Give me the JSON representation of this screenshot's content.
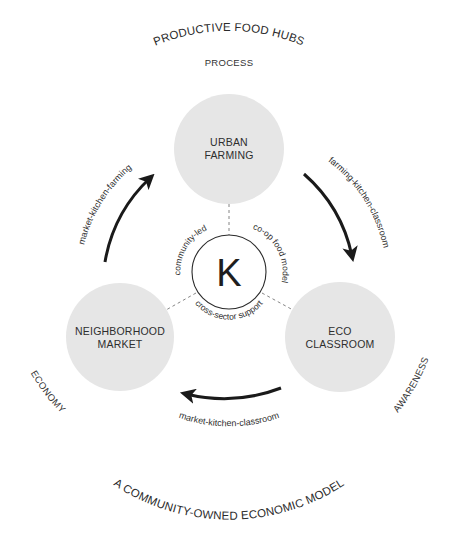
{
  "title_top": "PRODUCTIVE FOOD HUBS",
  "title_bottom": "A COMMUNITY-OWNED ECONOMIC MODEL",
  "themes": {
    "top": "PROCESS",
    "left": "ECONOMY",
    "right": "AWARENESS"
  },
  "nodes": [
    {
      "id": "urban-farming",
      "line1": "URBAN",
      "line2": "FARMING"
    },
    {
      "id": "neighborhood-market",
      "line1": "NEIGHBORHOOD",
      "line2": "MARKET"
    },
    {
      "id": "eco-classroom",
      "line1": "ECO",
      "line2": "CLASSROOM"
    }
  ],
  "flows": {
    "left": "market-kitchen-farming",
    "right": "farming-kitchen-classroom",
    "bottom": "market-kitchen-classroom"
  },
  "core": {
    "glyph": "K",
    "labels": {
      "upper_left": "community-led",
      "upper_right": "co-op food model",
      "bottom": "cross-sector support"
    }
  },
  "colors": {
    "node_fill": "#e6e6e6",
    "text": "#2e2e2e",
    "arrow": "#1a1a1a",
    "dashed_line": "#777777"
  }
}
